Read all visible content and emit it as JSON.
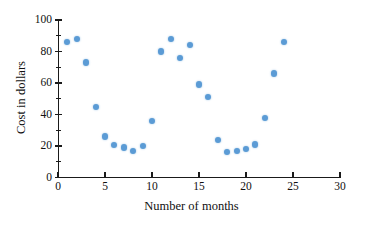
{
  "chart_data": {
    "type": "scatter",
    "title": "",
    "xlabel": "Number of months",
    "ylabel": "Cost in dollars",
    "xlim": [
      0,
      30
    ],
    "ylim": [
      0,
      100
    ],
    "xticks": [
      0,
      5,
      10,
      15,
      20,
      25,
      30
    ],
    "yticks": [
      0,
      20,
      40,
      60,
      80,
      100
    ],
    "y_minor_ticks": [
      10,
      30,
      50,
      70,
      90
    ],
    "grid": false,
    "legend": null,
    "marker_color": "#5b9bd5",
    "axis_color": "#1a1a1a",
    "x": [
      1,
      2,
      3,
      4,
      5,
      6,
      7,
      8,
      9,
      10,
      11,
      12,
      13,
      14,
      15,
      16,
      17,
      18,
      19,
      20,
      21,
      22,
      23,
      24
    ],
    "y": [
      86,
      88,
      73,
      45,
      26,
      20.5,
      19,
      17,
      20,
      36,
      80,
      88,
      76,
      84,
      59,
      51,
      24,
      16,
      17,
      18,
      21,
      38,
      66,
      86
    ],
    "points": [
      {
        "x": 1,
        "y": 86
      },
      {
        "x": 2,
        "y": 88
      },
      {
        "x": 3,
        "y": 73
      },
      {
        "x": 4,
        "y": 45
      },
      {
        "x": 5,
        "y": 26
      },
      {
        "x": 6,
        "y": 20.5
      },
      {
        "x": 7,
        "y": 19
      },
      {
        "x": 8,
        "y": 17
      },
      {
        "x": 9,
        "y": 20
      },
      {
        "x": 10,
        "y": 36
      },
      {
        "x": 11,
        "y": 80
      },
      {
        "x": 12,
        "y": 88
      },
      {
        "x": 13,
        "y": 76
      },
      {
        "x": 14,
        "y": 84
      },
      {
        "x": 15,
        "y": 59
      },
      {
        "x": 16,
        "y": 51
      },
      {
        "x": 17,
        "y": 24
      },
      {
        "x": 18,
        "y": 16
      },
      {
        "x": 19,
        "y": 17
      },
      {
        "x": 20,
        "y": 18
      },
      {
        "x": 21,
        "y": 21
      },
      {
        "x": 22,
        "y": 38
      },
      {
        "x": 23,
        "y": 66
      },
      {
        "x": 24,
        "y": 86
      }
    ]
  }
}
